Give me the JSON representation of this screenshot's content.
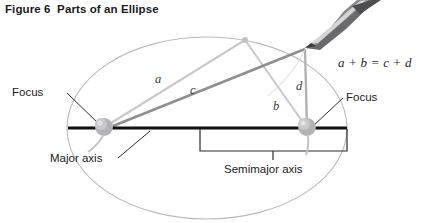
{
  "figure": {
    "title": "Figure 6  Parts of an Ellipse",
    "title_number": "Figure 6",
    "title_text": "Parts of an Ellipse"
  },
  "equation": "a + b = c + d",
  "labels": {
    "focus_left": "Focus",
    "focus_right": "Focus",
    "major_axis": "Major axis",
    "semimajor_axis": "Semimajor axis"
  },
  "segments": {
    "a": "a",
    "b": "b",
    "c": "c",
    "d": "d"
  },
  "colors": {
    "ellipse_outline": "#b9b9ba",
    "major_axis": "#111111",
    "string_light": "#c3c3c4",
    "string_dark": "#8d8d8f",
    "focus_pin": "#a9a9ab",
    "bracket": "#2b2b2b",
    "leader": "#2b2b2b",
    "pencil_body": "#6e6e70",
    "text": "#1a1a1a"
  },
  "geometry": {
    "ellipse_center": [
      207,
      128
    ],
    "ellipse_rx": 140,
    "ellipse_ry": 91,
    "focus_left_point": [
      103,
      128
    ],
    "focus_right_point": [
      307,
      128
    ],
    "pencil_tip": [
      305,
      48
    ],
    "string_apex": [
      245,
      40
    ],
    "major_axis_span": [
      68,
      347
    ],
    "semimajor_axis_span": [
      200,
      347
    ]
  }
}
